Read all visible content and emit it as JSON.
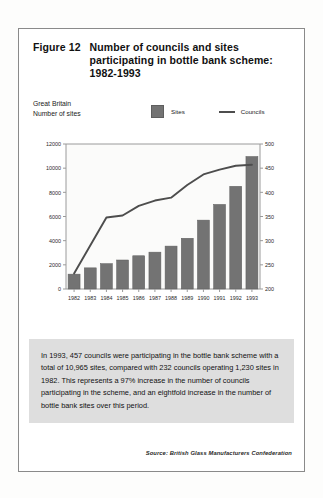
{
  "figure": {
    "label": "Figure 12",
    "title_line1": "Number of councils and sites",
    "title_line2": "participating in bottle bank scheme:",
    "title_line3": "1982-1993",
    "region": "Great Britain",
    "unit_label": "Number of sites",
    "caption": "In 1993, 457 councils were participating in the bottle bank scheme with a total of 10,965 sites, compared with 232 councils operating 1,230 sites in 1982. This represents a 97% increase in the number of councils participating in the scheme, and an eightfold increase in the number of bottle bank sites over this period.",
    "source": "Source: British Glass Manufacturers Confederation"
  },
  "colors": {
    "bar_fill": "#737373",
    "bar_stroke": "#5e5e5e",
    "line": "#4d4d4d",
    "axis": "#9a9a9a",
    "caption_bg": "#dedede",
    "frame": "#8a8a8a",
    "text": "#111111"
  },
  "chart_data": {
    "type": "bar",
    "title": "Number of councils and sites participating in bottle bank scheme: 1982-1993",
    "xlabel": "",
    "ylabel": "Number of sites",
    "categories": [
      "1982",
      "1983",
      "1984",
      "1985",
      "1986",
      "1987",
      "1988",
      "1989",
      "1990",
      "1991",
      "1992",
      "1993"
    ],
    "grid": false,
    "legend_position": "top",
    "series": [
      {
        "name": "Sites",
        "type": "bar",
        "axis": "left",
        "values": [
          1230,
          1750,
          2100,
          2400,
          2750,
          3050,
          3550,
          4200,
          5700,
          7000,
          8500,
          10965
        ]
      },
      {
        "name": "Councils",
        "type": "line",
        "axis": "right",
        "values": [
          232,
          290,
          348,
          352,
          372,
          383,
          389,
          415,
          437,
          447,
          455,
          457
        ]
      }
    ],
    "left_axis": {
      "label": "Number of sites",
      "ylim": [
        0,
        12000
      ],
      "ticks": [
        0,
        2000,
        4000,
        6000,
        8000,
        10000,
        12000
      ],
      "tick_labels": [
        "0",
        "2000",
        "4000",
        "6000",
        "8000",
        "10000",
        "12000"
      ]
    },
    "right_axis": {
      "label": "Councils",
      "ylim": [
        200,
        500
      ],
      "ticks": [
        200,
        250,
        300,
        350,
        400,
        450,
        500
      ],
      "tick_labels": [
        "200",
        "250",
        "300",
        "350",
        "400",
        "450",
        "500"
      ]
    }
  }
}
